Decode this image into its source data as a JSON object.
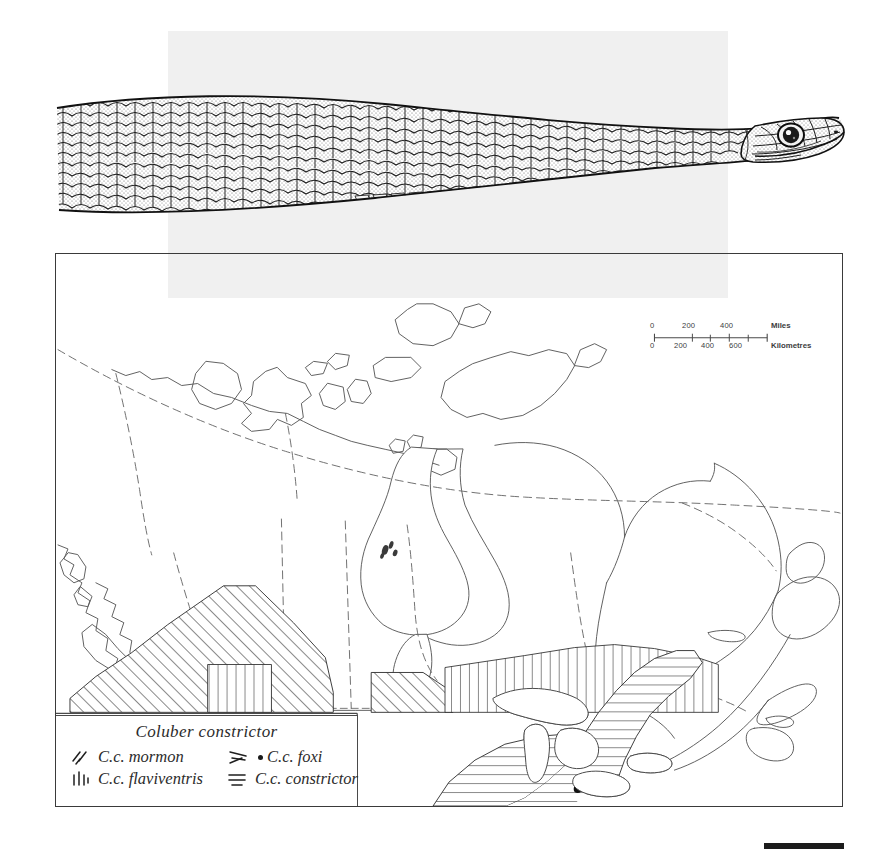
{
  "figure": {
    "type": "range-map-with-illustration",
    "species": "Coluber constrictor",
    "illustration_caption": "snake-dorsal-lateral-view"
  },
  "scale": {
    "miles_unit": "Miles",
    "kilometres_unit": "Kilometres",
    "miles_ticks": [
      "0",
      "200",
      "400"
    ],
    "km_ticks": [
      "0",
      "200",
      "400",
      "600"
    ]
  },
  "legend": {
    "title": "Coluber constrictor",
    "items": [
      {
        "label": "C.c. mormon",
        "pattern": "diagonal-hatch",
        "col": "left"
      },
      {
        "label": "C.c. flaviventris",
        "pattern": "vertical-hatch",
        "col": "left"
      },
      {
        "label": "C.c. foxi",
        "pattern": "converging-lines-dot",
        "col": "right"
      },
      {
        "label": "C.c. constrictor",
        "pattern": "horizontal-hatch",
        "col": "right"
      }
    ]
  },
  "colors": {
    "ink": "#2b2b2b",
    "map_line": "#5a5a5a",
    "frame": "#3a3a3a",
    "panel_grey": "#f0f0f0",
    "bar_black": "#1c1c1c"
  }
}
